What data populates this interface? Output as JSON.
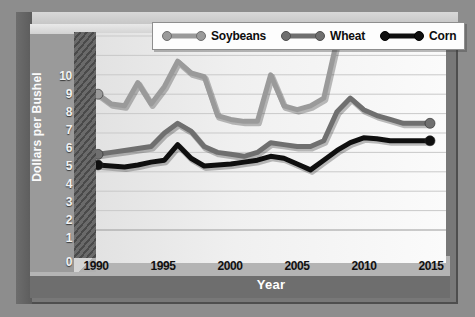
{
  "chart_data": {
    "type": "line",
    "title": "",
    "xlabel": "Year",
    "ylabel": "Dollars per Bushel",
    "xlim": [
      1990,
      2015
    ],
    "ylim": [
      0,
      10
    ],
    "grid": true,
    "legend_position": "top",
    "yticks": [
      10,
      9,
      8,
      7,
      6,
      5,
      4,
      3,
      2,
      1,
      0
    ],
    "xticks": [
      1990,
      1995,
      2000,
      2005,
      2010,
      2015
    ],
    "x": [
      1990,
      1991,
      1992,
      1993,
      1994,
      1995,
      1996,
      1997,
      1998,
      1999,
      2000,
      2001,
      2002,
      2003,
      2004,
      2005,
      2006,
      2007,
      2008,
      2009,
      2010,
      2011,
      2012,
      2013,
      2014,
      2015
    ],
    "series": [
      {
        "name": "Soybeans",
        "color": "#9a9a9a",
        "values": [
          7.0,
          6.5,
          6.4,
          7.6,
          6.5,
          7.4,
          8.7,
          8.1,
          7.9,
          5.9,
          5.7,
          5.6,
          5.6,
          8.0,
          6.4,
          6.2,
          6.4,
          6.8,
          9.8,
          9.6,
          9.7,
          9.9,
          10.0,
          10.0,
          10.0,
          10.0
        ]
      },
      {
        "name": "Wheat",
        "color": "#6f6f6f",
        "values": [
          3.9,
          4.0,
          4.1,
          4.2,
          4.3,
          5.0,
          5.5,
          5.1,
          4.3,
          4.0,
          3.9,
          3.8,
          4.0,
          4.5,
          4.4,
          4.3,
          4.3,
          4.6,
          6.1,
          6.8,
          6.2,
          5.9,
          5.7,
          5.5,
          5.5,
          5.5
        ]
      },
      {
        "name": "Corn",
        "color": "#0f0f0f",
        "values": [
          3.35,
          3.3,
          3.25,
          3.35,
          3.5,
          3.6,
          4.4,
          3.7,
          3.3,
          3.35,
          3.4,
          3.5,
          3.6,
          3.8,
          3.7,
          3.4,
          3.1,
          3.6,
          4.1,
          4.5,
          4.75,
          4.7,
          4.6,
          4.6,
          4.6,
          4.6
        ]
      }
    ]
  },
  "legend": {
    "items": [
      {
        "label": "Soybeans"
      },
      {
        "label": "Wheat"
      },
      {
        "label": "Corn"
      }
    ]
  },
  "axes": {
    "y_title": "Dollars per Bushel",
    "x_title": "Year",
    "y_tick_labels": [
      "10",
      "9",
      "8",
      "7",
      "6",
      "5",
      "4",
      "3",
      "2",
      "1",
      "0"
    ],
    "x_tick_labels": [
      "1990",
      "1995",
      "2000",
      "2005",
      "2010",
      "2015"
    ]
  }
}
